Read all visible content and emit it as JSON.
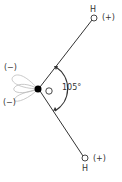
{
  "diagram": {
    "atoms": {
      "oxygen": {
        "label": "O"
      },
      "hydrogen_top": {
        "label": "H",
        "charge": "(+)"
      },
      "hydrogen_bottom": {
        "label": "H",
        "charge": "(+)"
      }
    },
    "lone_pairs": {
      "top_charge": "(−)",
      "bottom_charge": "(−)"
    },
    "bond_angle": "105°",
    "colors": {
      "line": "#333333",
      "lobe": "#bbbbbb",
      "dot": "#000000"
    }
  }
}
